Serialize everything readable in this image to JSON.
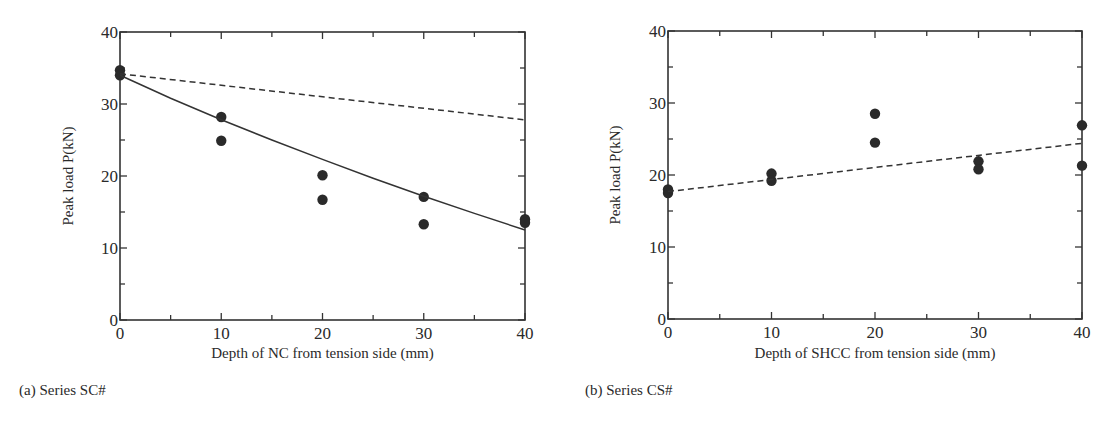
{
  "chart_data": [
    {
      "type": "scatter",
      "panel": "a",
      "caption": "(a) Series SC#",
      "title": "",
      "xlabel": "Depth of NC from tension side (mm)",
      "ylabel": "Peak load  P(kN)",
      "xlim": [
        0,
        40
      ],
      "ylim": [
        0,
        40
      ],
      "xticks": [
        0,
        10,
        20,
        30,
        40
      ],
      "yticks": [
        0,
        10,
        20,
        30,
        40
      ],
      "minor_tick_step": 5,
      "grid": false,
      "series": [
        {
          "name": "Experimental",
          "style": "filled-circle",
          "x": [
            0,
            0,
            10,
            10,
            20,
            20,
            30,
            30,
            40,
            40
          ],
          "y": [
            34.7,
            34.0,
            28.2,
            24.9,
            20.1,
            16.7,
            17.1,
            13.3,
            14.0,
            13.5
          ]
        },
        {
          "name": "Solid curve",
          "style": "solid-line",
          "x": [
            0,
            5,
            10,
            15,
            20,
            25,
            30,
            35,
            40
          ],
          "y": [
            34.0,
            30.8,
            27.8,
            25.0,
            22.3,
            19.7,
            17.2,
            14.8,
            12.5
          ]
        },
        {
          "name": "Dashed line",
          "style": "dashed-line",
          "x": [
            0,
            40
          ],
          "y": [
            34.2,
            27.8
          ]
        }
      ]
    },
    {
      "type": "scatter",
      "panel": "b",
      "caption": "(b) Series CS#",
      "title": "",
      "xlabel": "Depth of SHCC from tension side (mm)",
      "ylabel": "Peak load  P(kN)",
      "xlim": [
        0,
        40
      ],
      "ylim": [
        0,
        40
      ],
      "xticks": [
        0,
        10,
        20,
        30,
        40
      ],
      "yticks": [
        0,
        10,
        20,
        30,
        40
      ],
      "minor_tick_step": 5,
      "grid": false,
      "series": [
        {
          "name": "Experimental",
          "style": "filled-circle",
          "x": [
            0,
            0,
            10,
            10,
            20,
            20,
            30,
            30,
            40,
            40
          ],
          "y": [
            18.0,
            17.5,
            20.2,
            19.2,
            28.5,
            24.5,
            21.9,
            20.8,
            26.9,
            21.3
          ]
        },
        {
          "name": "Dashed line",
          "style": "dashed-line",
          "x": [
            0,
            40
          ],
          "y": [
            17.7,
            24.4
          ]
        }
      ]
    }
  ],
  "panels": {
    "a": {
      "caption": "(a) Series SC#",
      "xlabel": "Depth of NC from tension side (mm)",
      "ylabel": "Peak load  P(kN)"
    },
    "b": {
      "caption": "(b) Series CS#",
      "xlabel": "Depth of SHCC from tension side (mm)",
      "ylabel": "Peak load  P(kN)"
    }
  }
}
